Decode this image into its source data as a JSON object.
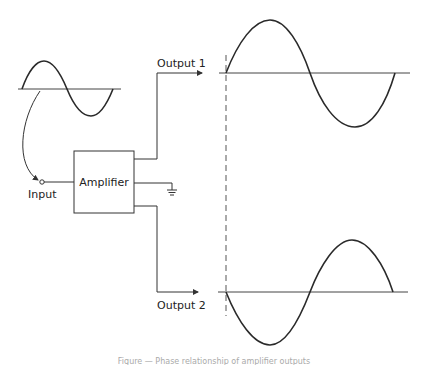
{
  "diagram": {
    "input_label": "Input",
    "amplifier_label": "Amplifier",
    "output1_label": "Output 1",
    "output2_label": "Output 2",
    "ground_symbol": "ground-icon",
    "caption": "Figure — Phase relationship of amplifier outputs"
  },
  "waveforms": {
    "input": {
      "phase_deg": 0,
      "cycles": 1
    },
    "output1": {
      "phase_deg": 0,
      "cycles": 1,
      "note": "in phase with input"
    },
    "output2": {
      "phase_deg": 180,
      "cycles": 1,
      "note": "inverted (180° out of phase)"
    }
  },
  "colors": {
    "line": "#333333",
    "background": "#ffffff"
  }
}
